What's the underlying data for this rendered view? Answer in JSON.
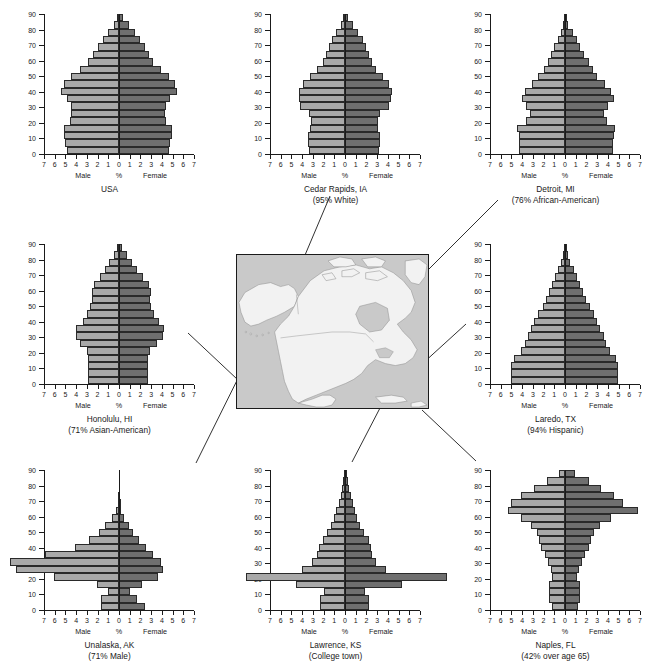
{
  "figure": {
    "axis": {
      "x_ticks": [
        7,
        6,
        5,
        4,
        3,
        2,
        1,
        0,
        1,
        2,
        3,
        4,
        5,
        6,
        7
      ],
      "y_ticks": [
        0,
        10,
        20,
        30,
        40,
        50,
        60,
        70,
        80,
        90
      ],
      "x_unit_label": "%",
      "male_label": "Male",
      "female_label": "Female",
      "age_groups": [
        "0-4",
        "5-9",
        "10-14",
        "15-19",
        "20-24",
        "25-29",
        "30-34",
        "35-39",
        "40-44",
        "45-49",
        "50-54",
        "55-59",
        "60-64",
        "65-69",
        "70-74",
        "75-79",
        "80-84",
        "85-89",
        "90+"
      ]
    },
    "colors": {
      "male_bar": "#a9a9a9",
      "female_bar": "#6f6f6f",
      "bar_outline": "#2a2a2a",
      "axis": "#1a1a1a",
      "map_ocean": "#c9c9c9",
      "map_land": "#f2f2f2",
      "map_border": "#1a1a1a",
      "connector": "#1a1a1a"
    }
  },
  "chart_data": [
    {
      "id": "usa",
      "type": "bar",
      "title": "USA",
      "subtitle": "",
      "xlabel": "%",
      "ylabel": "",
      "xlim": [
        -7,
        7
      ],
      "ylim": [
        0,
        90
      ],
      "grid": false,
      "categories": [
        "0-4",
        "5-9",
        "10-14",
        "15-19",
        "20-24",
        "25-29",
        "30-34",
        "35-39",
        "40-44",
        "45-49",
        "50-54",
        "55-59",
        "60-64",
        "65-69",
        "70-74",
        "75-79",
        "80-84",
        "85-89",
        "90+"
      ],
      "series": [
        {
          "name": "Male",
          "values": [
            4.9,
            5.0,
            5.1,
            5.1,
            4.6,
            4.5,
            4.5,
            4.9,
            5.4,
            5.1,
            4.5,
            3.6,
            2.9,
            2.4,
            2.0,
            1.5,
            1.0,
            0.5,
            0.2
          ]
        },
        {
          "name": "Female",
          "values": [
            4.7,
            4.8,
            4.9,
            4.9,
            4.4,
            4.3,
            4.4,
            4.8,
            5.4,
            5.2,
            4.7,
            3.9,
            3.2,
            2.8,
            2.4,
            2.0,
            1.5,
            0.9,
            0.4
          ]
        }
      ]
    },
    {
      "id": "cedar-rapids",
      "type": "bar",
      "title": "Cedar Rapids, IA",
      "subtitle": "(95% White)",
      "xlabel": "%",
      "ylabel": "",
      "xlim": [
        -7,
        7
      ],
      "ylim": [
        0,
        90
      ],
      "grid": false,
      "categories": [
        "0-4",
        "5-9",
        "10-14",
        "15-19",
        "20-24",
        "25-29",
        "30-34",
        "35-39",
        "40-44",
        "45-49",
        "50-54",
        "55-59",
        "60-64",
        "65-69",
        "70-74",
        "75-79",
        "80-84",
        "85-89",
        "90+"
      ],
      "series": [
        {
          "name": "Male",
          "values": [
            3.4,
            3.5,
            3.5,
            3.3,
            3.2,
            3.4,
            4.2,
            4.3,
            4.3,
            3.9,
            3.3,
            2.6,
            2.1,
            1.8,
            1.5,
            1.2,
            0.8,
            0.4,
            0.2
          ]
        },
        {
          "name": "Female",
          "values": [
            3.2,
            3.3,
            3.3,
            3.1,
            3.1,
            3.3,
            4.1,
            4.3,
            4.4,
            4.1,
            3.5,
            2.9,
            2.5,
            2.2,
            2.0,
            1.7,
            1.2,
            0.7,
            0.3
          ]
        }
      ]
    },
    {
      "id": "detroit",
      "type": "bar",
      "title": "Detroit, MI",
      "subtitle": "(76% African-American)",
      "xlabel": "%",
      "ylabel": "",
      "xlim": [
        -7,
        7
      ],
      "ylim": [
        0,
        90
      ],
      "grid": false,
      "categories": [
        "0-4",
        "5-9",
        "10-14",
        "15-19",
        "20-24",
        "25-29",
        "30-34",
        "35-39",
        "40-44",
        "45-49",
        "50-54",
        "55-59",
        "60-64",
        "65-69",
        "70-74",
        "75-79",
        "80-84",
        "85-89",
        "90+"
      ],
      "series": [
        {
          "name": "Male",
          "values": [
            4.3,
            4.3,
            4.3,
            4.5,
            3.6,
            3.3,
            3.6,
            4.0,
            3.7,
            3.1,
            2.5,
            2.0,
            1.6,
            1.3,
            1.0,
            0.7,
            0.4,
            0.2,
            0.1
          ]
        },
        {
          "name": "Female",
          "values": [
            4.5,
            4.5,
            4.6,
            4.7,
            3.9,
            3.6,
            4.0,
            4.6,
            4.3,
            3.7,
            3.0,
            2.6,
            2.2,
            1.8,
            1.4,
            1.1,
            0.7,
            0.3,
            0.1
          ]
        }
      ]
    },
    {
      "id": "honolulu",
      "type": "bar",
      "title": "Honolulu, HI",
      "subtitle": "(71% Asian-American)",
      "xlabel": "%",
      "ylabel": "",
      "xlim": [
        -7,
        7
      ],
      "ylim": [
        0,
        90
      ],
      "grid": false,
      "categories": [
        "0-4",
        "5-9",
        "10-14",
        "15-19",
        "20-24",
        "25-29",
        "30-34",
        "35-39",
        "40-44",
        "45-49",
        "50-54",
        "55-59",
        "60-64",
        "65-69",
        "70-74",
        "75-79",
        "80-84",
        "85-89",
        "90+"
      ],
      "series": [
        {
          "name": "Male",
          "values": [
            2.9,
            2.9,
            2.9,
            2.9,
            3.0,
            3.6,
            4.0,
            4.0,
            3.4,
            3.0,
            2.7,
            2.5,
            2.5,
            2.3,
            1.8,
            1.3,
            0.9,
            0.5,
            0.2
          ]
        },
        {
          "name": "Female",
          "values": [
            2.7,
            2.7,
            2.7,
            2.7,
            2.9,
            3.5,
            4.1,
            4.2,
            3.7,
            3.3,
            3.0,
            2.9,
            3.0,
            2.8,
            2.2,
            1.7,
            1.2,
            0.7,
            0.3
          ]
        }
      ]
    },
    {
      "id": "laredo",
      "type": "bar",
      "title": "Laredo, TX",
      "subtitle": "(94% Hispanic)",
      "xlabel": "%",
      "ylabel": "",
      "xlim": [
        -7,
        7
      ],
      "ylim": [
        0,
        90
      ],
      "grid": false,
      "categories": [
        "0-4",
        "5-9",
        "10-14",
        "15-19",
        "20-24",
        "25-29",
        "30-34",
        "35-39",
        "40-44",
        "45-49",
        "50-54",
        "55-59",
        "60-64",
        "65-69",
        "70-74",
        "75-79",
        "80-84",
        "85-89",
        "90+"
      ],
      "series": [
        {
          "name": "Male",
          "values": [
            5.0,
            5.0,
            5.0,
            4.8,
            4.1,
            3.7,
            3.5,
            3.2,
            2.9,
            2.5,
            2.1,
            1.8,
            1.5,
            1.2,
            0.9,
            0.7,
            0.4,
            0.2,
            0.1
          ]
        },
        {
          "name": "Female",
          "values": [
            4.9,
            4.9,
            4.9,
            4.8,
            4.2,
            3.8,
            3.6,
            3.3,
            3.0,
            2.7,
            2.3,
            2.0,
            1.7,
            1.4,
            1.1,
            0.8,
            0.5,
            0.3,
            0.1
          ]
        }
      ]
    },
    {
      "id": "unalaska",
      "type": "bar",
      "title": "Unalaska, AK",
      "subtitle": "(71% Male)",
      "xlabel": "%",
      "ylabel": "",
      "xlim": [
        -7,
        7
      ],
      "grid": false,
      "ylim": [
        0,
        90
      ],
      "note": "bars exceed plotted axis range",
      "categories": [
        "0-4",
        "5-9",
        "10-14",
        "15-19",
        "20-24",
        "25-29",
        "30-34",
        "35-39",
        "40-44",
        "45-49",
        "50-54",
        "55-59",
        "60-64",
        "65-69",
        "70-74",
        "75-79",
        "80-84",
        "85-89",
        "90+"
      ],
      "series": [
        {
          "name": "Male",
          "values": [
            1.7,
            1.7,
            1.0,
            2.1,
            6.1,
            9.6,
            10.2,
            6.9,
            4.1,
            2.8,
            1.9,
            1.3,
            0.7,
            0.3,
            0.1,
            0.05,
            0.0,
            0.0,
            0.0
          ]
        },
        {
          "name": "Female",
          "values": [
            2.4,
            1.7,
            1.0,
            2.1,
            3.6,
            4.1,
            3.9,
            3.2,
            2.5,
            1.9,
            1.3,
            0.9,
            0.5,
            0.2,
            0.05,
            0.0,
            0.0,
            0.0,
            0.0
          ]
        }
      ]
    },
    {
      "id": "lawrence",
      "type": "bar",
      "title": "Lawrence, KS",
      "subtitle": "(College town)",
      "xlabel": "%",
      "ylabel": "",
      "xlim": [
        -7,
        7
      ],
      "ylim": [
        0,
        90
      ],
      "grid": false,
      "note": "20-24 bar exceeds plotted axis range",
      "categories": [
        "0-4",
        "5-9",
        "10-14",
        "15-19",
        "20-24",
        "25-29",
        "30-34",
        "35-39",
        "40-44",
        "45-49",
        "50-54",
        "55-59",
        "60-64",
        "65-69",
        "70-74",
        "75-79",
        "80-84",
        "85-89",
        "90+"
      ],
      "series": [
        {
          "name": "Male",
          "values": [
            2.3,
            2.3,
            2.0,
            4.6,
            9.2,
            4.0,
            3.1,
            2.6,
            2.4,
            2.1,
            1.7,
            1.3,
            1.0,
            0.8,
            0.6,
            0.4,
            0.3,
            0.15,
            0.05
          ]
        },
        {
          "name": "Female",
          "values": [
            2.2,
            2.2,
            1.9,
            5.3,
            9.5,
            3.8,
            2.9,
            2.5,
            2.4,
            2.2,
            1.8,
            1.4,
            1.1,
            0.9,
            0.7,
            0.6,
            0.4,
            0.25,
            0.1
          ]
        }
      ]
    },
    {
      "id": "naples",
      "type": "bar",
      "title": "Naples, FL",
      "subtitle": "(42% over age 65)",
      "xlabel": "%",
      "ylabel": "",
      "xlim": [
        -7,
        7
      ],
      "ylim": [
        0,
        90
      ],
      "grid": false,
      "categories": [
        "0-4",
        "5-9",
        "10-14",
        "15-19",
        "20-24",
        "25-29",
        "30-34",
        "35-39",
        "40-44",
        "45-49",
        "50-54",
        "55-59",
        "60-64",
        "65-69",
        "70-74",
        "75-79",
        "80-84",
        "85-89",
        "90+"
      ],
      "series": [
        {
          "name": "Male",
          "values": [
            1.2,
            1.5,
            1.5,
            1.5,
            1.2,
            1.3,
            1.6,
            1.9,
            2.2,
            2.4,
            2.6,
            3.2,
            4.1,
            5.3,
            5.0,
            4.1,
            2.9,
            1.7,
            0.6
          ]
        },
        {
          "name": "Female",
          "values": [
            1.2,
            1.4,
            1.4,
            1.4,
            1.1,
            1.3,
            1.6,
            1.9,
            2.2,
            2.4,
            2.7,
            3.3,
            4.3,
            6.8,
            5.4,
            4.6,
            3.4,
            2.2,
            0.9
          ]
        }
      ]
    }
  ],
  "map": {
    "name": "north-america-map",
    "description": "Outline map of North America with Alaska, Canada, United States and northern Mexico"
  },
  "connectors": [
    {
      "from": "cedar-rapids",
      "to": "map"
    },
    {
      "from": "detroit",
      "to": "map"
    },
    {
      "from": "honolulu",
      "to": "map"
    },
    {
      "from": "laredo",
      "to": "map"
    },
    {
      "from": "unalaska",
      "to": "map"
    },
    {
      "from": "lawrence",
      "to": "map"
    },
    {
      "from": "naples",
      "to": "map"
    }
  ]
}
